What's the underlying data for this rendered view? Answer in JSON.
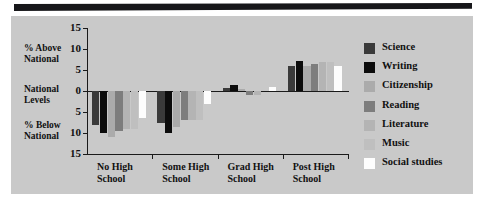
{
  "figure": {
    "background_color": "#c9c9c9",
    "page_color": "#ffffff",
    "top_rule_color": "#17171a"
  },
  "annotations": {
    "above_national": "% Above\nNational",
    "national_levels": "National\nLevels",
    "below_national": "% Below\nNational"
  },
  "legend": {
    "position": "right",
    "entries": [
      {
        "label": "Science",
        "color": "#3a3a3a"
      },
      {
        "label": "Writing",
        "color": "#0c0c0c"
      },
      {
        "label": "Citizenship",
        "color": "#ababab"
      },
      {
        "label": "Reading",
        "color": "#7d7d7d"
      },
      {
        "label": "Literature",
        "color": "#b4b4b4"
      },
      {
        "label": "Music",
        "color": "#bfbfbf"
      },
      {
        "label": "Social studies",
        "color": "#fdfdfd"
      }
    ]
  },
  "chart_data": {
    "type": "bar",
    "title": "",
    "subtitle": "",
    "xlabel": "",
    "ylabel": "",
    "ylim": [
      -15,
      15
    ],
    "grid": false,
    "y_ticks": [
      15,
      10,
      5,
      0,
      5,
      10,
      15
    ],
    "y_tick_values": [
      15,
      10,
      5,
      0,
      -5,
      -10,
      -15
    ],
    "categories": [
      "No High\nSchool",
      "Some High\nSchool",
      "Grad High\nSchool",
      "Post High\nSchool"
    ],
    "category_labels_flat": [
      "No High School",
      "Some High School",
      "Grad High School",
      "Post High School"
    ],
    "series": [
      {
        "name": "Science",
        "color": "#3a3a3a",
        "values": [
          -8.0,
          -7.5,
          0.8,
          6.0
        ]
      },
      {
        "name": "Writing",
        "color": "#0c0c0c",
        "values": [
          -10.0,
          -10.0,
          1.5,
          7.2
        ]
      },
      {
        "name": "Citizenship",
        "color": "#ababab",
        "values": [
          -11.0,
          -8.5,
          0.4,
          6.0
        ]
      },
      {
        "name": "Reading",
        "color": "#7d7d7d",
        "values": [
          -9.5,
          -7.0,
          -1.0,
          6.5
        ]
      },
      {
        "name": "Literature",
        "color": "#b4b4b4",
        "values": [
          -9.0,
          -7.0,
          -1.0,
          7.0
        ]
      },
      {
        "name": "Music",
        "color": "#bfbfbf",
        "values": [
          -9.0,
          -7.0,
          0.0,
          7.0
        ]
      },
      {
        "name": "Social studies",
        "color": "#fdfdfd",
        "values": [
          -6.5,
          -3.0,
          1.0,
          6.0
        ]
      }
    ]
  }
}
